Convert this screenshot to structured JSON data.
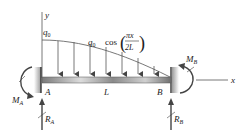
{
  "diagram": {
    "axes": {
      "x_label": "x",
      "y_label": "y"
    },
    "load": {
      "max_label": "q",
      "max_sub": "0",
      "expr_q": "q",
      "expr_sub": "0",
      "expr_cos": "cos",
      "expr_num": "πx",
      "expr_den": "2L",
      "arrow_count": 7
    },
    "beam": {
      "length_label": "L"
    },
    "supports": {
      "left": {
        "point": "A",
        "moment": "M",
        "moment_sub": "A",
        "reaction": "R",
        "reaction_sub": "A"
      },
      "right": {
        "point": "B",
        "moment": "M",
        "moment_sub": "B",
        "reaction": "R",
        "reaction_sub": "B"
      }
    },
    "colors": {
      "beam_dark": "#6e6e6e",
      "beam_light": "#d8d8d8",
      "line": "#555555",
      "wall": "#333333"
    }
  }
}
